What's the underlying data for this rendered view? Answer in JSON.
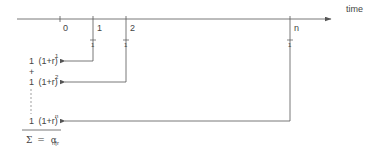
{
  "diagram": {
    "axis_label": "time",
    "ticks": [
      {
        "label": "0"
      },
      {
        "label": "1",
        "payment": "1"
      },
      {
        "label": "2",
        "payment": "1"
      },
      {
        "label": "n",
        "payment": "1"
      }
    ],
    "terms": [
      {
        "coef": "1",
        "base": "(1+r)",
        "exp": "1"
      },
      {
        "coef": "1",
        "base": "(1+r)",
        "exp": "2"
      },
      {
        "coef": "1",
        "base": "(1+r)",
        "exp": "n"
      }
    ],
    "plus_sign": "+",
    "sum": {
      "symbol": "Σ",
      "equals": "=",
      "alpha": "α",
      "subscript": "n|r"
    },
    "colors": {
      "line": "#555555",
      "text": "#444444",
      "background": "#ffffff"
    }
  }
}
